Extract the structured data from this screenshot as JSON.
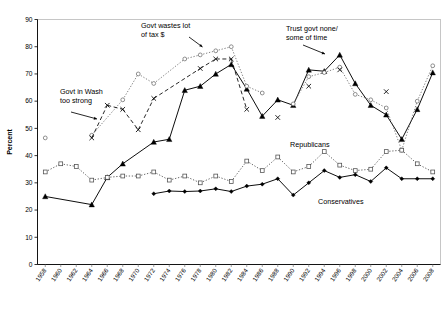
{
  "chart_data": {
    "type": "line",
    "title": "",
    "xlabel": "",
    "ylabel": "Percent",
    "ylim": [
      0,
      90
    ],
    "ytick_step": 10,
    "yticks": [
      0,
      10,
      20,
      30,
      40,
      50,
      60,
      70,
      80,
      90
    ],
    "grid": false,
    "legend_position": "inline-annotations",
    "x": [
      1958,
      1960,
      1962,
      1964,
      1966,
      1968,
      1970,
      1972,
      1974,
      1976,
      1978,
      1980,
      1982,
      1984,
      1986,
      1988,
      1990,
      1992,
      1994,
      1996,
      1998,
      2000,
      2002,
      2004,
      2006,
      2008
    ],
    "xtick_labels": [
      "1958",
      "1960",
      "1962",
      "1964",
      "1966",
      "1968",
      "1970",
      "1972",
      "1974",
      "1976",
      "1978",
      "1980",
      "1982",
      "1984",
      "1986",
      "1988",
      "1990",
      "1992",
      "1994",
      "1996",
      "1998",
      "2000",
      "2002",
      "2004",
      "2006",
      "2008"
    ],
    "series": [
      {
        "name": "Trust govt none/some of time",
        "marker": "filled-triangle",
        "linestyle": "solid",
        "color": "#000000",
        "points": [
          {
            "x": 1958,
            "y": 25,
            "connected": false
          },
          {
            "x": 1964,
            "y": 22,
            "connected": true
          },
          {
            "x": 1966,
            "y": 32,
            "connected": true
          },
          {
            "x": 1968,
            "y": 37,
            "connected": true
          },
          {
            "x": 1972,
            "y": 45,
            "connected": true
          },
          {
            "x": 1974,
            "y": 46,
            "connected": true
          },
          {
            "x": 1976,
            "y": 64,
            "connected": true
          },
          {
            "x": 1978,
            "y": 65.5,
            "connected": true
          },
          {
            "x": 1980,
            "y": 70,
            "connected": true
          },
          {
            "x": 1982,
            "y": 73.5,
            "connected": true
          },
          {
            "x": 1984,
            "y": 64.5,
            "connected": true
          },
          {
            "x": 1986,
            "y": 54.5,
            "connected": true
          },
          {
            "x": 1988,
            "y": 60.5,
            "connected": true
          },
          {
            "x": 1990,
            "y": 58.5,
            "connected": true
          },
          {
            "x": 1992,
            "y": 71.5,
            "connected": true
          },
          {
            "x": 1994,
            "y": 71,
            "connected": true
          },
          {
            "x": 1996,
            "y": 77,
            "connected": true
          },
          {
            "x": 1998,
            "y": 66.5,
            "connected": true
          },
          {
            "x": 2000,
            "y": 58.5,
            "connected": true
          },
          {
            "x": 2002,
            "y": 55,
            "connected": true
          },
          {
            "x": 2004,
            "y": 46,
            "connected": true
          },
          {
            "x": 2006,
            "y": 57,
            "connected": true
          },
          {
            "x": 2008,
            "y": 70.5,
            "connected": true
          }
        ]
      },
      {
        "name": "Govt wastes lot of tax $",
        "marker": "open-circle",
        "linestyle": "dotted",
        "color": "#6b6b6b",
        "points": [
          {
            "x": 1958,
            "y": 46.5,
            "connected": false
          },
          {
            "x": 1964,
            "y": 47.5,
            "connected": false
          },
          {
            "x": 1968,
            "y": 60.5,
            "connected": true
          },
          {
            "x": 1970,
            "y": 70,
            "connected": true
          },
          {
            "x": 1972,
            "y": 66.5,
            "connected": true
          },
          {
            "x": 1976,
            "y": 75.5,
            "connected": true
          },
          {
            "x": 1978,
            "y": 77,
            "connected": true
          },
          {
            "x": 1980,
            "y": 78.5,
            "connected": true
          },
          {
            "x": 1982,
            "y": 80,
            "connected": true
          },
          {
            "x": 1984,
            "y": 65.5,
            "connected": true
          },
          {
            "x": 1986,
            "y": 63,
            "connected": true
          },
          {
            "x": 1990,
            "y": 59,
            "connected": false
          },
          {
            "x": 1992,
            "y": 69,
            "connected": true
          },
          {
            "x": 1994,
            "y": 70.5,
            "connected": true
          },
          {
            "x": 1996,
            "y": 72.5,
            "connected": true
          },
          {
            "x": 1998,
            "y": 62.5,
            "connected": true
          },
          {
            "x": 2000,
            "y": 60.5,
            "connected": true
          },
          {
            "x": 2002,
            "y": 57.5,
            "connected": true
          },
          {
            "x": 2004,
            "y": 42,
            "connected": true
          },
          {
            "x": 2006,
            "y": 60,
            "connected": true
          },
          {
            "x": 2008,
            "y": 73,
            "connected": true
          }
        ]
      },
      {
        "name": "Govt in Wash too strong",
        "marker": "cross-x",
        "linestyle": "dashed",
        "color": "#000000",
        "points": [
          {
            "x": 1964,
            "y": 46.5,
            "connected": true
          },
          {
            "x": 1966,
            "y": 58.5,
            "connected": true
          },
          {
            "x": 1968,
            "y": 57,
            "connected": true
          },
          {
            "x": 1970,
            "y": 49.5,
            "connected": true
          },
          {
            "x": 1972,
            "y": 61,
            "connected": true
          },
          {
            "x": 1978,
            "y": 72,
            "connected": true
          },
          {
            "x": 1980,
            "y": 75.5,
            "connected": true
          },
          {
            "x": 1982,
            "y": 75.5,
            "connected": true
          },
          {
            "x": 1984,
            "y": 57,
            "connected": true
          },
          {
            "x": 1988,
            "y": 54,
            "connected": false
          },
          {
            "x": 1992,
            "y": 65.5,
            "connected": false
          },
          {
            "x": 1996,
            "y": 71.5,
            "connected": false
          },
          {
            "x": 2002,
            "y": 63.5,
            "connected": false
          }
        ]
      },
      {
        "name": "Republicans",
        "marker": "open-square",
        "linestyle": "dotted",
        "color": "#4d4d4d",
        "points": [
          {
            "x": 1958,
            "y": 34,
            "connected": true
          },
          {
            "x": 1960,
            "y": 37,
            "connected": true
          },
          {
            "x": 1962,
            "y": 36,
            "connected": true
          },
          {
            "x": 1964,
            "y": 31,
            "connected": true
          },
          {
            "x": 1966,
            "y": 32,
            "connected": true
          },
          {
            "x": 1968,
            "y": 32.5,
            "connected": true
          },
          {
            "x": 1970,
            "y": 32.5,
            "connected": true
          },
          {
            "x": 1972,
            "y": 34,
            "connected": true
          },
          {
            "x": 1974,
            "y": 31,
            "connected": true
          },
          {
            "x": 1976,
            "y": 32.5,
            "connected": true
          },
          {
            "x": 1978,
            "y": 30,
            "connected": true
          },
          {
            "x": 1980,
            "y": 32.5,
            "connected": true
          },
          {
            "x": 1982,
            "y": 30.5,
            "connected": true
          },
          {
            "x": 1984,
            "y": 38,
            "connected": true
          },
          {
            "x": 1986,
            "y": 34.5,
            "connected": true
          },
          {
            "x": 1988,
            "y": 39.5,
            "connected": true
          },
          {
            "x": 1990,
            "y": 34,
            "connected": true
          },
          {
            "x": 1992,
            "y": 36,
            "connected": true
          },
          {
            "x": 1994,
            "y": 41.5,
            "connected": true
          },
          {
            "x": 1996,
            "y": 36.5,
            "connected": true
          },
          {
            "x": 1998,
            "y": 34.5,
            "connected": true
          },
          {
            "x": 2000,
            "y": 35,
            "connected": true
          },
          {
            "x": 2002,
            "y": 41.5,
            "connected": true
          },
          {
            "x": 2004,
            "y": 42,
            "connected": true
          },
          {
            "x": 2006,
            "y": 37,
            "connected": true
          },
          {
            "x": 2008,
            "y": 34,
            "connected": true
          }
        ]
      },
      {
        "name": "Conservatives",
        "marker": "filled-diamond",
        "linestyle": "solid",
        "color": "#000000",
        "points": [
          {
            "x": 1972,
            "y": 26,
            "connected": true
          },
          {
            "x": 1974,
            "y": 27,
            "connected": true
          },
          {
            "x": 1976,
            "y": 26.8,
            "connected": true
          },
          {
            "x": 1978,
            "y": 27,
            "connected": true
          },
          {
            "x": 1980,
            "y": 27.8,
            "connected": true
          },
          {
            "x": 1982,
            "y": 26.8,
            "connected": true
          },
          {
            "x": 1984,
            "y": 28.8,
            "connected": true
          },
          {
            "x": 1986,
            "y": 29.5,
            "connected": true
          },
          {
            "x": 1988,
            "y": 31.5,
            "connected": true
          },
          {
            "x": 1990,
            "y": 25.5,
            "connected": true
          },
          {
            "x": 1992,
            "y": 30,
            "connected": true
          },
          {
            "x": 1994,
            "y": 34.5,
            "connected": true
          },
          {
            "x": 1996,
            "y": 32,
            "connected": true
          },
          {
            "x": 1998,
            "y": 33,
            "connected": true
          },
          {
            "x": 2000,
            "y": 30.5,
            "connected": true
          },
          {
            "x": 2002,
            "y": 35.5,
            "connected": true
          },
          {
            "x": 2004,
            "y": 31.5,
            "connected": true
          },
          {
            "x": 2006,
            "y": 31.5,
            "connected": true
          },
          {
            "x": 2008,
            "y": 31.5,
            "connected": true
          }
        ]
      }
    ],
    "annotations": [
      {
        "id": "govt-wastes",
        "line1": "Govt wastes lot",
        "line2": "of tax $"
      },
      {
        "id": "govt-in-wash",
        "line1": "Govt in Wash",
        "line2": "too strong"
      },
      {
        "id": "trust-govt",
        "line1": "Trust govt none/",
        "line2": "some of time"
      },
      {
        "id": "republicans",
        "line1": "Republicans",
        "line2": ""
      },
      {
        "id": "conservatives",
        "line1": "Conservatives",
        "line2": ""
      }
    ]
  },
  "axis": {
    "y_title": "Percent",
    "y_ticks": [
      "0",
      "10",
      "20",
      "30",
      "40",
      "50",
      "60",
      "70",
      "80",
      "90"
    ],
    "x_ticks": [
      "1958",
      "1960",
      "1962",
      "1964",
      "1966",
      "1968",
      "1970",
      "1972",
      "1974",
      "1976",
      "1978",
      "1980",
      "1982",
      "1984",
      "1986",
      "1988",
      "1990",
      "1992",
      "1994",
      "1996",
      "1998",
      "2000",
      "2002",
      "2004",
      "2006",
      "2008"
    ]
  },
  "colors": {
    "axis": "#000000",
    "plot_border": "#b8b8b8",
    "solid_series": "#000000",
    "circle_series": "#6b6b6b",
    "square_series": "#4d4d4d",
    "background": "#ffffff"
  }
}
